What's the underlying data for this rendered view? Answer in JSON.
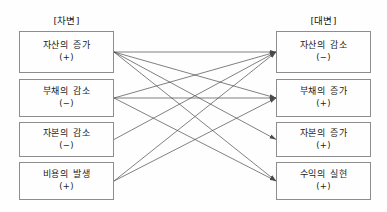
{
  "diagram": {
    "title_left": "[차변]",
    "title_right": "[대변]",
    "left_nodes": [
      {
        "label": "자산의 증가",
        "sign": "(+)",
        "x": 19,
        "y": 31,
        "w": 95,
        "h": 42
      },
      {
        "label": "부채의 감소",
        "sign": "(−)",
        "x": 19,
        "y": 79,
        "w": 95,
        "h": 38
      },
      {
        "label": "자본의 감소",
        "sign": "(−)",
        "x": 19,
        "y": 122,
        "w": 95,
        "h": 35
      },
      {
        "label": "비용의 발생",
        "sign": "(+)",
        "x": 19,
        "y": 162,
        "w": 95,
        "h": 38
      }
    ],
    "right_nodes": [
      {
        "label": "자산의 감소",
        "sign": "(−)",
        "x": 276,
        "y": 31,
        "w": 95,
        "h": 42
      },
      {
        "label": "부채의 증가",
        "sign": "(+)",
        "x": 276,
        "y": 79,
        "w": 95,
        "h": 38
      },
      {
        "label": "자본의 증가",
        "sign": "(+)",
        "x": 276,
        "y": 122,
        "w": 95,
        "h": 35
      },
      {
        "label": "수익의 실현",
        "sign": "(+)",
        "x": 276,
        "y": 162,
        "w": 95,
        "h": 38
      }
    ],
    "connections": [
      {
        "from": 0,
        "to": 0
      },
      {
        "from": 0,
        "to": 1
      },
      {
        "from": 0,
        "to": 2
      },
      {
        "from": 0,
        "to": 3
      },
      {
        "from": 1,
        "to": 0
      },
      {
        "from": 1,
        "to": 1
      },
      {
        "from": 1,
        "to": 3
      },
      {
        "from": 2,
        "to": 0
      },
      {
        "from": 3,
        "to": 0
      },
      {
        "from": 3,
        "to": 1
      }
    ],
    "colors": {
      "box_border": "#8d8d8d",
      "line": "#4a4a4a",
      "text": "#1a1a1a",
      "background": "#fefefe"
    }
  }
}
